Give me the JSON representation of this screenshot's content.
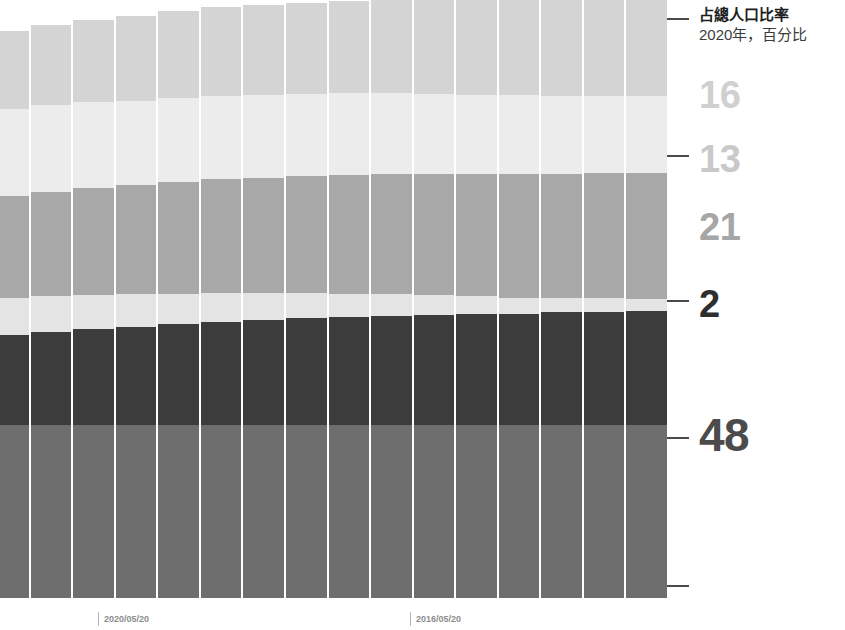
{
  "header": {
    "title": "占總人口比率",
    "subtitle": "2020年，百分比"
  },
  "axis": {
    "labels": [
      {
        "text": "16",
        "color": "#d0d0d0",
        "size": 38,
        "top": 76
      },
      {
        "text": "13",
        "color": "#c9c9c9",
        "size": 38,
        "top": 140
      },
      {
        "text": "21",
        "color": "#a6a6a6",
        "size": 38,
        "top": 208
      },
      {
        "text": "2",
        "color": "#2e2e2e",
        "size": 38,
        "top": 285
      },
      {
        "text": "48",
        "color": "#4b4b4b",
        "size": 46,
        "top": 412
      }
    ],
    "ticks": [
      18,
      155,
      300,
      437,
      585
    ]
  },
  "xaxis": {
    "labels": [
      {
        "text": "2020/05/20",
        "left": 98
      },
      {
        "text": "2016/05/20",
        "left": 410
      }
    ]
  },
  "colors": {
    "band_1": "#d4d4d4",
    "band_2": "#ececec",
    "band_3": "#a8a8a8",
    "band_4": "#e4e4e4",
    "band_5": "#3c3c3c",
    "band_6": "#6e6e6e",
    "separator": "#ffffff",
    "gridline": "#9a9a9a",
    "tick": "#4a4a4a"
  },
  "chart_data": {
    "type": "area",
    "title": "占總人口比率",
    "subtitle": "2020年，百分比",
    "xlabel": "",
    "ylabel": "",
    "ylim": [
      0,
      100
    ],
    "grid": true,
    "legend_position": "right",
    "stacked": true,
    "categories": [
      "2020/05/20",
      "",
      "",
      "",
      "",
      "",
      "",
      "",
      "2016/05/20",
      "",
      "",
      "",
      "",
      "",
      "",
      ""
    ],
    "series": [
      {
        "name": "16",
        "color": "#d4d4d4",
        "label_value": 16,
        "values": [
          13.0,
          13.4,
          13.8,
          14.2,
          14.5,
          14.8,
          15.0,
          15.2,
          15.4,
          15.6,
          15.8,
          15.9,
          16.0,
          16.0,
          16.0,
          16.0
        ]
      },
      {
        "name": "13",
        "color": "#ececec",
        "label_value": 13,
        "values": [
          14.6,
          14.5,
          14.4,
          14.2,
          14.1,
          14.0,
          13.8,
          13.7,
          13.6,
          13.5,
          13.4,
          13.3,
          13.2,
          13.1,
          13.0,
          13.0
        ]
      },
      {
        "name": "21",
        "color": "#a8a8a8",
        "label_value": 21,
        "values": [
          17.0,
          17.4,
          17.8,
          18.2,
          18.6,
          19.0,
          19.3,
          19.6,
          19.9,
          20.1,
          20.3,
          20.5,
          20.7,
          20.8,
          20.9,
          21.0
        ]
      },
      {
        "name": "2",
        "color": "#e4e4e4",
        "label_value": 2,
        "values": [
          6.2,
          6.0,
          5.7,
          5.4,
          5.1,
          4.8,
          4.5,
          4.2,
          3.9,
          3.6,
          3.3,
          3.0,
          2.7,
          2.4,
          2.2,
          2.0
        ]
      },
      {
        "name": "48",
        "color": "#3c3c3c",
        "label_value": 48,
        "values": [
          15.0,
          15.5,
          16.0,
          16.4,
          16.8,
          17.2,
          17.5,
          17.8,
          18.0,
          18.2,
          18.4,
          18.6,
          18.7,
          18.8,
          18.9,
          19.0
        ]
      },
      {
        "name": "base",
        "color": "#6e6e6e",
        "label_value": null,
        "values": [
          29.0,
          29.0,
          29.0,
          29.0,
          29.0,
          29.0,
          29.0,
          29.0,
          29.0,
          29.0,
          29.0,
          29.0,
          29.0,
          29.0,
          29.0,
          29.0
        ]
      }
    ],
    "gridline_positions": [
      96,
      168,
      240,
      302,
      374,
      446,
      518
    ],
    "annotations": []
  }
}
